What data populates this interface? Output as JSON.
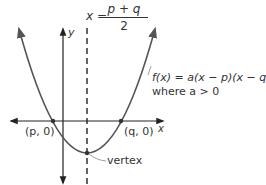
{
  "diagram": {
    "title_equation": {
      "lhs": "x =",
      "numerator": "p + q",
      "denominator": "2"
    },
    "function_label": {
      "line1": "f(x) = a(x − p)(x − q),",
      "line2": "where a > 0"
    },
    "axes": {
      "x_label": "x",
      "y_label": "y"
    },
    "points": {
      "p_root": "(p, 0)",
      "q_root": "(q, 0)",
      "vertex": "vertex"
    },
    "colors": {
      "curve": "#555555",
      "axes": "#222222",
      "text": "#333333"
    }
  }
}
